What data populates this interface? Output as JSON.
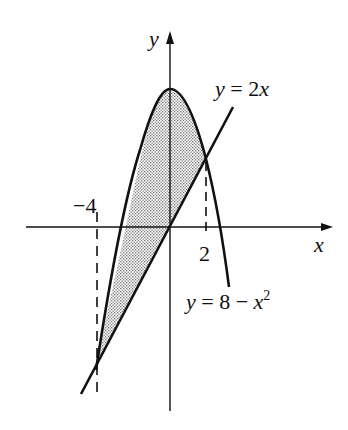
{
  "figure": {
    "axis_labels": {
      "x": "x",
      "y": "y"
    },
    "tick_labels": {
      "neg4": "−4",
      "pos2": "2"
    },
    "curves": {
      "line": {
        "label": "y = 2x",
        "equation": "y = 2x"
      },
      "parabola": {
        "label_prefix": "y = 8 − x",
        "label_exp": "2",
        "equation": "y = 8 - x^2"
      }
    },
    "shaded_region": "between y = 8 − x² and y = 2x for −4 ≤ x ≤ 2",
    "intersections": [
      {
        "x": -4,
        "y": -8
      },
      {
        "x": 2,
        "y": 4
      }
    ],
    "colors": {
      "ink": "#111111",
      "shade": "#9a9a9a",
      "background": "#ffffff"
    }
  }
}
